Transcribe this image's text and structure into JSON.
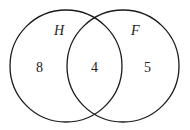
{
  "diagram": {
    "type": "venn",
    "sets": [
      {
        "name": "H",
        "only_count": "8"
      },
      {
        "name": "F",
        "only_count": "5"
      }
    ],
    "intersection_count": "4",
    "colors": {
      "stroke": "#1a1a1a",
      "background": "#ffffff",
      "text": "#222222"
    }
  }
}
